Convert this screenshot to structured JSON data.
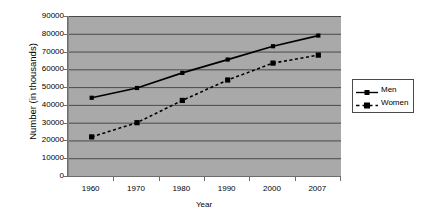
{
  "chart_data": {
    "type": "line",
    "title": "",
    "xlabel": "Year",
    "ylabel": "Number (in thousands)",
    "categories": [
      "1960",
      "1970",
      "1980",
      "1990",
      "2000",
      "2007"
    ],
    "x": [
      1960,
      1970,
      1980,
      1990,
      2000,
      2007
    ],
    "series": [
      {
        "name": "Men",
        "values": [
          44000,
          49500,
          58000,
          65500,
          73000,
          79000
        ],
        "line_style": "solid",
        "marker": "square",
        "color": "#000000"
      },
      {
        "name": "Women",
        "values": [
          22000,
          30000,
          42500,
          54000,
          63500,
          68000
        ],
        "line_style": "dashed",
        "marker": "square",
        "color": "#000000"
      }
    ],
    "ylim": [
      0,
      90000
    ],
    "ytick_labels": [
      "0",
      "10000",
      "20000",
      "30000",
      "40000",
      "50000",
      "60000",
      "70000",
      "80000",
      "90000"
    ],
    "ytick_values": [
      0,
      10000,
      20000,
      30000,
      40000,
      50000,
      60000,
      70000,
      80000,
      90000
    ],
    "grid": "horizontal",
    "legend_position": "right",
    "plot_background": "#a9a9a9",
    "gridline_color": "#4a4a4a",
    "page_background": "#ffffff"
  },
  "legend": {
    "entries": [
      {
        "label": "Men"
      },
      {
        "label": "Women"
      }
    ]
  },
  "axes": {
    "x_title": "Year",
    "y_title": "Number (in thousands)"
  }
}
